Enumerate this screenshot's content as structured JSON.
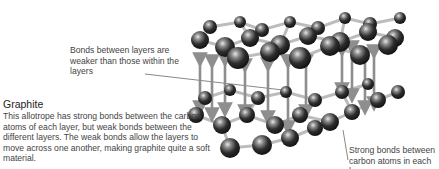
{
  "diagram": {
    "title": "Graphite",
    "description": "This allotrope has strong bonds between the carbon atoms of each layer, but weak bonds between the different layers. The weak bonds allow the layers to move across one another, making graphite quite a soft material.",
    "annotations": {
      "weak_bonds": "Bonds between layers are weaker than those within the layers",
      "strong_bonds": "Strong bonds between carbon atoms in each layer"
    },
    "colors": {
      "atom": "#2a2a2a",
      "atom_highlight": "#d8d8d8",
      "bond": "#b5b5b5",
      "interlayer_arrow": "#8e8e8e",
      "text": "#444444"
    }
  }
}
